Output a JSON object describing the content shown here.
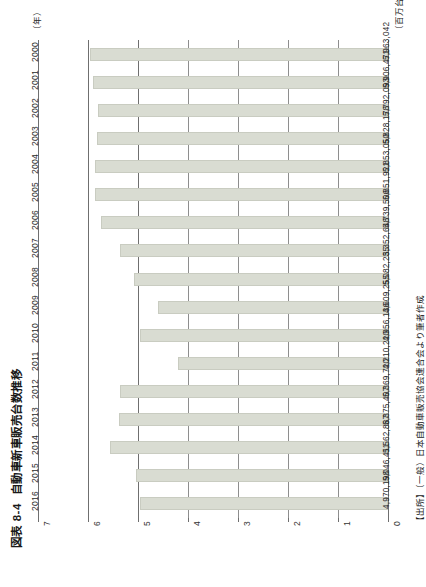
{
  "figure": {
    "number": "図表 8-4",
    "title": "自動車新車販売台数推移",
    "category_axis_title": "（年）",
    "unit_caption": "（百万台）",
    "source_note": "【出所】（一般）日本自動車販売協会連合会より筆者作成"
  },
  "colors": {
    "bar_fill": "#d9dcd2",
    "bar_stroke": "#c9ccc1",
    "gridline": "#8e8e8e",
    "axis": "#6f6f6f",
    "text": "#1a1a1a",
    "background": "#ffffff"
  },
  "chart_data": {
    "type": "bar",
    "orientation": "horizontal",
    "title": "自動車新車販売台数推移",
    "xlabel": "（年）",
    "ylabel": "（百万台）",
    "ylim": [
      0,
      7
    ],
    "grid": true,
    "legend": false,
    "tick_labels": [
      "0",
      "1",
      "2",
      "3",
      "4",
      "5",
      "6",
      "7"
    ],
    "tick_values": [
      0,
      1,
      2,
      3,
      4,
      5,
      6,
      7
    ],
    "categories": [
      "2000",
      "2001",
      "2002",
      "2003",
      "2004",
      "2005",
      "2006",
      "2007",
      "2008",
      "2009",
      "2010",
      "2011",
      "2012",
      "2013",
      "2014",
      "2015",
      "2016"
    ],
    "values": [
      5963042,
      5906471,
      5792093,
      5828178,
      5853050,
      5851921,
      5739506,
      5352648,
      5082235,
      4609255,
      4956136,
      4210220,
      5369720,
      5375407,
      5562887,
      5046411,
      4970198
    ],
    "value_labels": [
      "5,963,042",
      "5,906,471",
      "5,792,093",
      "5,828,178",
      "5,853,050",
      "5,851,921",
      "5,739,506",
      "5,352,648",
      "5,082,235",
      "4,609,255",
      "4,956,136",
      "4,210,220",
      "5,369,720",
      "5,375,407",
      "5,562,887",
      "5,046,411",
      "4,970,198"
    ]
  }
}
